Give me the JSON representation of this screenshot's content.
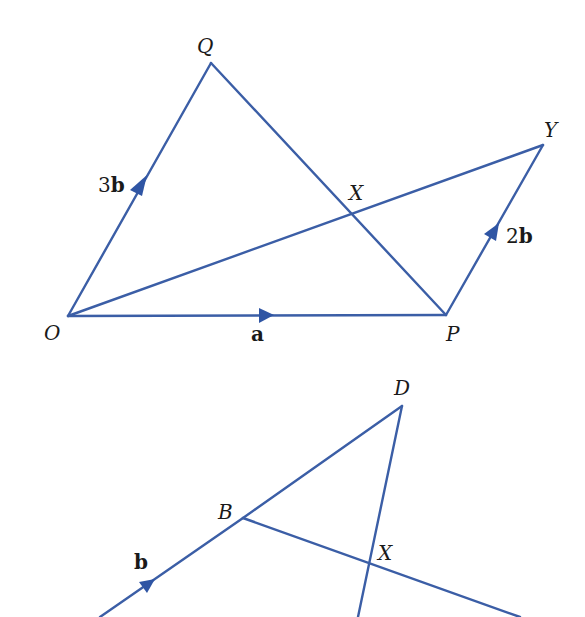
{
  "figures": [
    {
      "id": "figure-1",
      "points": {
        "O": {
          "label": "O",
          "x": 68,
          "y": 316
        },
        "Q": {
          "label": "Q",
          "x": 211,
          "y": 63
        },
        "P": {
          "label": "P",
          "x": 446,
          "y": 315
        },
        "Y": {
          "label": "Y",
          "x": 543,
          "y": 145
        },
        "X": {
          "label": "X",
          "x": 350,
          "y": 208
        }
      },
      "segments": [
        {
          "from": "O",
          "to": "Q",
          "vector_label": "3b",
          "coefficient": "3",
          "symbol": "b",
          "arrow": true
        },
        {
          "from": "O",
          "to": "P",
          "vector_label": "a",
          "coefficient": "",
          "symbol": "a",
          "arrow": true
        },
        {
          "from": "P",
          "to": "Y",
          "vector_label": "2b",
          "coefficient": "2",
          "symbol": "b",
          "arrow": true
        },
        {
          "from": "Q",
          "to": "P",
          "arrow": false
        },
        {
          "from": "O",
          "to": "Y",
          "arrow": false
        }
      ]
    },
    {
      "id": "figure-2",
      "points": {
        "B": {
          "label": "B",
          "x": 243,
          "y": 518
        },
        "D": {
          "label": "D",
          "x": 402,
          "y": 406
        },
        "X": {
          "label": "X",
          "x": 370,
          "y": 563
        }
      },
      "segments": [
        {
          "from": "A",
          "to": "B",
          "vector_label": "b",
          "coefficient": "",
          "symbol": "b",
          "arrow": true
        },
        {
          "from": "B",
          "to": "D",
          "arrow": false
        },
        {
          "from": "D",
          "to": "X",
          "arrow": false,
          "extends_beyond": true
        },
        {
          "from": "B",
          "to": "X",
          "arrow": false,
          "extends_beyond": true
        }
      ]
    }
  ],
  "colors": {
    "line": "#3b5ea6",
    "arrow": "#2f55a4",
    "text": "#1a1a1a",
    "background": "#ffffff"
  }
}
